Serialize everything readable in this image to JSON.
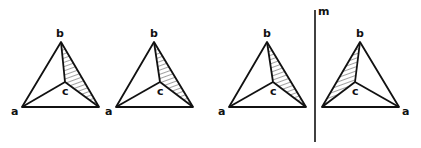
{
  "figure": {
    "mirror_label": "m",
    "stroke_color": "#111111",
    "background": "#ffffff",
    "tetrahedra": [
      {
        "id": "t1",
        "labels": {
          "a": "a",
          "b": "b",
          "c": "c"
        },
        "hatched_face": "b-c-right"
      },
      {
        "id": "t2",
        "labels": {
          "a": "a",
          "b": "b",
          "c": "c"
        },
        "hatched_face": "b-c-right"
      },
      {
        "id": "t3",
        "labels": {
          "a": "a",
          "b": "b",
          "c": "c"
        },
        "hatched_face": "b-c-right"
      },
      {
        "id": "t4",
        "labels": {
          "a": "a",
          "b": "b",
          "c": "c"
        },
        "hatched_face": "b-c-left",
        "mirrored": true
      }
    ]
  }
}
